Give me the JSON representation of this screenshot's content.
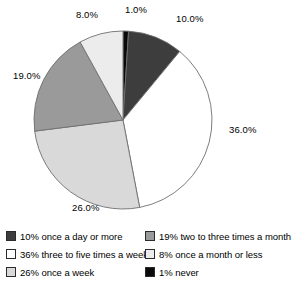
{
  "chart_data": {
    "type": "pie",
    "title": "",
    "subtitle": "",
    "xlabel": "",
    "ylabel": "",
    "grid": false,
    "legend_position": "bottom",
    "start_angle_deg": 0,
    "direction": "clockwise",
    "categories": [
      "never",
      "once a day or more",
      "three to five times a week",
      "once a week",
      "two to three times a month",
      "once a month or less"
    ],
    "values": [
      1,
      10,
      36,
      26,
      19,
      8
    ],
    "slice_labels": [
      "1.0%",
      "10.0%",
      "36.0%",
      "26.0%",
      "19.0%",
      "8.0%"
    ],
    "colors": [
      "#0a0a0a",
      "#3d3d3d",
      "#ffffff",
      "#d9d9d9",
      "#9a9a9a",
      "#ececec"
    ],
    "legend_entries": [
      "10% once a day or more",
      "36% three to five times a week",
      "26% once a week",
      "19% two to three times a month",
      "8% once a month or less",
      "1% never"
    ]
  },
  "slices": [
    {
      "key": "never",
      "label": "1.0%",
      "value": 1,
      "color": "#0a0a0a"
    },
    {
      "key": "once-a-day-or-more",
      "label": "10.0%",
      "value": 10,
      "color": "#3d3d3d"
    },
    {
      "key": "three-to-five-times-a-week",
      "label": "36.0%",
      "value": 36,
      "color": "#ffffff"
    },
    {
      "key": "once-a-week",
      "label": "26.0%",
      "value": 26,
      "color": "#d9d9d9"
    },
    {
      "key": "two-to-three-times-a-month",
      "label": "19.0%",
      "value": 19,
      "color": "#9a9a9a"
    },
    {
      "key": "once-a-month-or-less",
      "label": "8.0%",
      "value": 8,
      "color": "#ececec"
    }
  ],
  "legend": {
    "left_column": [
      {
        "swatch": "#3d3d3d",
        "label": "10% once a day or more"
      },
      {
        "swatch": "#ffffff",
        "label": "36% three to five times a week"
      },
      {
        "swatch": "#d9d9d9",
        "label": "26% once a week"
      }
    ],
    "right_column": [
      {
        "swatch": "#9a9a9a",
        "label": "19% two to three times a month"
      },
      {
        "swatch": "#ececec",
        "label": "8% once a month or less"
      },
      {
        "swatch": "#0a0a0a",
        "label": "1% never"
      }
    ]
  },
  "geometry": {
    "cx": 123,
    "cy": 120,
    "r": 89
  }
}
